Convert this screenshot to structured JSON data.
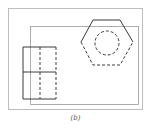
{
  "figure": {
    "caption": "(b)",
    "colors": {
      "frame": "#bdbdbd",
      "line": "#3a3a3a",
      "background": "#ffffff"
    },
    "elements": [
      {
        "id": "outer-frame",
        "shape": "rectangle",
        "style": "solid-thin"
      },
      {
        "id": "inner-sheet",
        "shape": "rectangle",
        "style": "solid-thin"
      },
      {
        "id": "hexagon-top-view",
        "shape": "hexagon",
        "style": "top-solid, rest-dashed"
      },
      {
        "id": "hidden-circle",
        "shape": "circle",
        "style": "dashed"
      },
      {
        "id": "front-view-block",
        "shape": "rectangle-grid",
        "rows": 2,
        "cols": 2,
        "style": "left-solid, right-dashed"
      }
    ]
  }
}
